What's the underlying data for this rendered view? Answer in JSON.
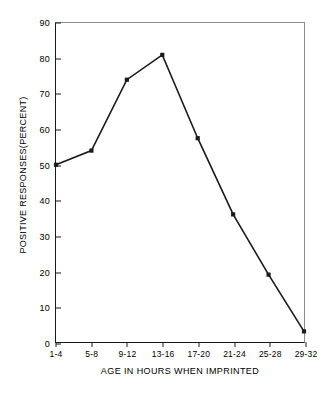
{
  "chart_data": {
    "type": "line",
    "title": "",
    "subtitle": "",
    "xlabel": "AGE IN HOURS WHEN IMPRINTED",
    "ylabel": "POSITIVE RESPONSES(PERCENT)",
    "categories": [
      "1-4",
      "5-8",
      "9-12",
      "13-16",
      "17-20",
      "21-24",
      "25-28",
      "29-32"
    ],
    "values": [
      50,
      54,
      74,
      81,
      57.5,
      36,
      19,
      3
    ],
    "series": [
      {
        "name": "positive responses",
        "values": [
          50,
          54,
          74,
          81,
          57.5,
          36,
          19,
          3
        ]
      }
    ],
    "ylim": [
      0,
      90
    ],
    "yticks": [
      0,
      10,
      20,
      30,
      40,
      50,
      60,
      70,
      80,
      90
    ],
    "ytick_labels": [
      "0",
      "10",
      "20",
      "30",
      "40",
      "50",
      "60",
      "70",
      "80",
      "90"
    ],
    "xtick_labels": [
      "1-4",
      "5-8",
      "9-12",
      "13-16",
      "17-20",
      "21-24",
      "25-28",
      "29-32"
    ],
    "grid": false,
    "legend": false,
    "legend_position": "none",
    "marker": "square",
    "line_color": "#1a1a1a",
    "marker_color": "#1a1a1a",
    "axis_color": "#1a1a1a",
    "frame_color": "#8c8c8c",
    "background": "#ffffff"
  }
}
